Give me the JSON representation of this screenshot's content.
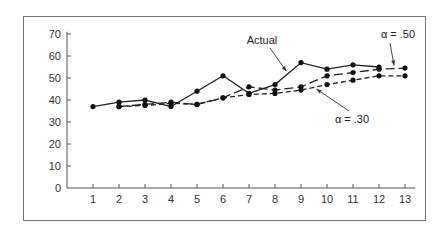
{
  "chart_data": {
    "type": "line",
    "title": "",
    "xlabel": "",
    "ylabel": "",
    "x": [
      1,
      2,
      3,
      4,
      5,
      6,
      7,
      8,
      9,
      10,
      11,
      12,
      13
    ],
    "xlim": [
      0,
      13.4
    ],
    "ylim": [
      0,
      70
    ],
    "x_ticks": [
      "1",
      "2",
      "3",
      "4",
      "5",
      "6",
      "7",
      "8",
      "9",
      "10",
      "11",
      "12",
      "13"
    ],
    "y_ticks": [
      "0",
      "10",
      "20",
      "30",
      "40",
      "50",
      "60",
      "70"
    ],
    "grid": false,
    "series": [
      {
        "name": "Actual",
        "style": "solid",
        "values": [
          37,
          39,
          40,
          37,
          44,
          51,
          43,
          47,
          57,
          54,
          56,
          55,
          null
        ]
      },
      {
        "name": "α = .50",
        "style": "long-dash",
        "values": [
          null,
          37,
          38,
          39,
          38,
          41,
          46,
          44.5,
          46,
          51,
          52.5,
          54,
          54.5
        ]
      },
      {
        "name": "α = .30",
        "style": "short-dash",
        "values": [
          null,
          37,
          37.5,
          38.5,
          38,
          41,
          42.5,
          43,
          44.5,
          47,
          49,
          51,
          51
        ]
      }
    ],
    "annotations": [
      {
        "text": "Actual",
        "target_series": "Actual",
        "target_x": 8.5
      },
      {
        "text": "α = .50",
        "target_series": "α = .50",
        "target_x": 12.6
      },
      {
        "text": "α = .30",
        "target_series": "α = .30",
        "target_x": 9.5
      }
    ],
    "legend": "none (inline annotations with arrows)"
  }
}
